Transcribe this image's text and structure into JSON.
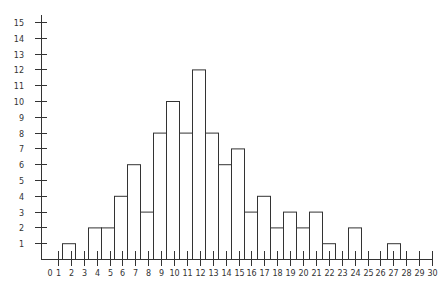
{
  "chart_data": {
    "type": "bar",
    "title": "",
    "xlabel": "",
    "ylabel": "",
    "x_ticks": [
      "0",
      "1",
      "2",
      "3",
      "4",
      "5",
      "6",
      "7",
      "8",
      "9",
      "10",
      "11",
      "12",
      "13",
      "14",
      "15",
      "16",
      "17",
      "18",
      "19",
      "20",
      "21",
      "22",
      "23",
      "24",
      "25",
      "26",
      "27",
      "28",
      "29",
      "30"
    ],
    "y_ticks": [
      "1",
      "2",
      "3",
      "4",
      "5",
      "6",
      "7",
      "8",
      "9",
      "10",
      "11",
      "12",
      "13",
      "14",
      "15"
    ],
    "categories": [
      1,
      2,
      3,
      4,
      5,
      6,
      7,
      8,
      9,
      10,
      11,
      12,
      13,
      14,
      15,
      16,
      17,
      18,
      19,
      20,
      21,
      22,
      23,
      24,
      25,
      26,
      27
    ],
    "values": [
      0,
      1,
      0,
      2,
      2,
      4,
      6,
      3,
      8,
      10,
      8,
      12,
      8,
      6,
      7,
      3,
      4,
      2,
      3,
      2,
      3,
      1,
      0,
      2,
      0,
      0,
      1
    ],
    "xlim": [
      0,
      30
    ],
    "ylim": [
      0,
      15
    ],
    "grid": false,
    "legend": null,
    "colors": {
      "bar_fill": "#ffffff",
      "bar_stroke": "#333333",
      "axis": "#333333"
    }
  }
}
